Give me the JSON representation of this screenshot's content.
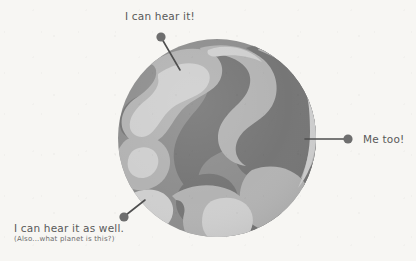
{
  "scene": {
    "title": "Planet with annotated callouts",
    "background_color": "#f7f6f3"
  },
  "planet": {
    "name": "unknown-planet",
    "center_x": 217,
    "center_y": 138,
    "radius": 99,
    "colors": {
      "base_mid": "#8e8e8e",
      "dark": "#767676",
      "light": "#b3b3b3",
      "lightest": "#cfcfcf"
    }
  },
  "annotations": [
    {
      "id": "top",
      "text": "I can hear it!",
      "subtext": "",
      "dot_x": 161,
      "dot_y": 37,
      "target_x": 180,
      "target_y": 70,
      "dot_color": "#6e6e6e",
      "line_color": "#4f4f4f"
    },
    {
      "id": "right",
      "text": "Me too!",
      "subtext": "",
      "dot_x": 348,
      "dot_y": 139,
      "target_x": 305,
      "target_y": 139,
      "dot_color": "#6e6e6e",
      "line_color": "#4f4f4f"
    },
    {
      "id": "bottom",
      "text": "I can hear it as well.",
      "subtext": "(Also...what planet is this?)",
      "dot_x": 124,
      "dot_y": 217,
      "target_x": 144,
      "target_y": 201,
      "dot_color": "#6e6e6e",
      "line_color": "#4f4f4f"
    }
  ]
}
